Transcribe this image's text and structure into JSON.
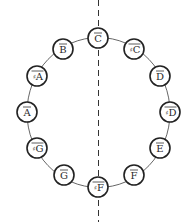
{
  "diagram": {
    "type": "pitch-class-circle",
    "center": {
      "x": 98.5,
      "y": 112.5
    },
    "radius_x": 71.5,
    "radius_y": 75,
    "node_radius": 10,
    "axis": {
      "style": "dashed",
      "x": 98.5,
      "y1": 0,
      "y2": 222,
      "color": "#333333"
    },
    "nodes": [
      {
        "id": "C",
        "sharp": false,
        "letter": "C",
        "x": 98,
        "y": 38
      },
      {
        "id": "Cs",
        "sharp": true,
        "letter": "C",
        "x": 134,
        "y": 49
      },
      {
        "id": "D",
        "sharp": false,
        "letter": "D",
        "x": 160,
        "y": 76
      },
      {
        "id": "Ds",
        "sharp": true,
        "letter": "D",
        "x": 170,
        "y": 112
      },
      {
        "id": "E",
        "sharp": false,
        "letter": "E",
        "x": 160,
        "y": 148
      },
      {
        "id": "F",
        "sharp": false,
        "letter": "F",
        "x": 134,
        "y": 175
      },
      {
        "id": "Fs",
        "sharp": true,
        "letter": "F",
        "x": 98,
        "y": 187
      },
      {
        "id": "G",
        "sharp": false,
        "letter": "G",
        "x": 64,
        "y": 175
      },
      {
        "id": "Gs",
        "sharp": true,
        "letter": "G",
        "x": 37,
        "y": 148
      },
      {
        "id": "A",
        "sharp": false,
        "letter": "A",
        "x": 27,
        "y": 112
      },
      {
        "id": "As",
        "sharp": true,
        "letter": "A",
        "x": 37,
        "y": 76
      },
      {
        "id": "B",
        "sharp": false,
        "letter": "B",
        "x": 63,
        "y": 49
      }
    ],
    "sharp_symbol": "♯",
    "label_decoration": "overline",
    "colors": {
      "stroke": "#222222",
      "text": "#2a2a2a",
      "background": "#ffffff"
    }
  }
}
